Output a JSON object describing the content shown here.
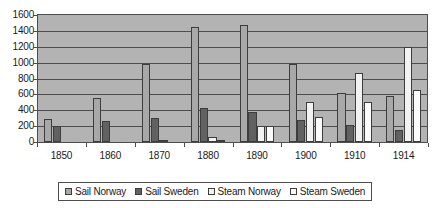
{
  "chart_data": {
    "type": "bar",
    "title": "",
    "subtitle": "",
    "xlabel": "",
    "ylabel": "",
    "categories": [
      "1850",
      "1860",
      "1870",
      "1880",
      "1890",
      "1900",
      "1910",
      "1914"
    ],
    "ylim": [
      0,
      1600
    ],
    "yticks": [
      0,
      200,
      400,
      600,
      800,
      1000,
      1200,
      1400,
      1600
    ],
    "ytick_labels": [
      "0",
      "200",
      "400",
      "600",
      "800",
      "1000",
      "1200",
      "1400",
      "1600"
    ],
    "grid": true,
    "legend_position": "bottom",
    "series": [
      {
        "name": "Sail Norway",
        "color": "#a8a8a8",
        "values": [
          290,
          550,
          980,
          1450,
          1480,
          980,
          620,
          580
        ]
      },
      {
        "name": "Sail Sweden",
        "color": "#616161",
        "values": [
          200,
          270,
          300,
          430,
          380,
          280,
          220,
          150
        ]
      },
      {
        "name": "Steam Norway",
        "color": "#f2f2f2",
        "values": [
          0,
          0,
          20,
          60,
          200,
          500,
          870,
          1200
        ]
      },
      {
        "name": "Steam Sweden",
        "color": "#fafafa",
        "values": [
          0,
          0,
          0,
          30,
          200,
          310,
          500,
          650
        ]
      }
    ]
  },
  "legend": {
    "items": [
      {
        "label": "Sail Norway"
      },
      {
        "label": "Sail Sweden"
      },
      {
        "label": "Steam Norway"
      },
      {
        "label": "Steam Sweden"
      }
    ]
  }
}
